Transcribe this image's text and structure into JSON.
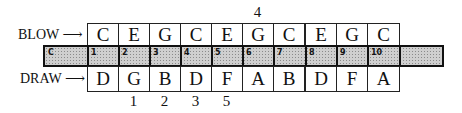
{
  "diagram": {
    "type": "harmonica-note-layout",
    "blow_label": "BLOW",
    "draw_label": "DRAW",
    "arrow": "⟶",
    "comb_key": "C",
    "holes": [
      "1",
      "2",
      "3",
      "4",
      "5",
      "6",
      "7",
      "8",
      "9",
      "10"
    ],
    "blow_notes": [
      "C",
      "E",
      "G",
      "C",
      "E",
      "G",
      "C",
      "E",
      "G",
      "C"
    ],
    "draw_notes": [
      "D",
      "G",
      "B",
      "D",
      "F",
      "A",
      "B",
      "D",
      "F",
      "A"
    ],
    "top_markers": [
      {
        "column": 6,
        "label": "4"
      }
    ],
    "bottom_markers": [
      {
        "column": 2,
        "label": "1"
      },
      {
        "column": 3,
        "label": "2"
      },
      {
        "column": 4,
        "label": "3"
      },
      {
        "column": 5,
        "label": "5"
      }
    ]
  }
}
